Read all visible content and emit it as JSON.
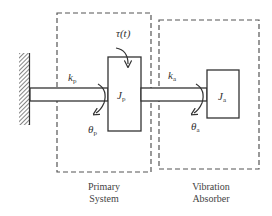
{
  "diagram": {
    "colors": {
      "line": "#333333",
      "dash": "#555555",
      "text": "#333333",
      "background": "#ffffff"
    },
    "labels": {
      "torque": "τ(t)",
      "kp_main": "k",
      "kp_sub": "p",
      "Jp_main": "J",
      "Jp_sub": "p",
      "thetap_main": "θ",
      "thetap_sub": "p",
      "ka_main": "k",
      "ka_sub": "a",
      "Ja_main": "J",
      "Ja_sub": "a",
      "thetaa_main": "θ",
      "thetaa_sub": "a"
    },
    "groups": {
      "primary": {
        "line1": "Primary",
        "line2": "System"
      },
      "absorber": {
        "line1": "Vibration",
        "line2": "Absorber"
      }
    },
    "components": [
      "fixed-wall",
      "primary-shaft",
      "primary-inertia",
      "absorber-shaft",
      "absorber-inertia"
    ]
  }
}
